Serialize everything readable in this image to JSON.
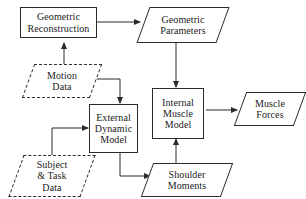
{
  "diagram": {
    "stroke_color": "#2b2b2b",
    "background_color": "#ffffff",
    "nodes": [
      {
        "id": "geometric-reconstruction",
        "label": "Geometric\nReconstruction",
        "shape": "rectangle",
        "border": "solid"
      },
      {
        "id": "geometric-parameters",
        "label": "Geometric\nParameters",
        "shape": "parallelogram",
        "border": "solid"
      },
      {
        "id": "motion-data",
        "label": "Motion\nData",
        "shape": "parallelogram",
        "border": "dashed"
      },
      {
        "id": "external-dynamic-model",
        "label": "External\nDynamic\nModel",
        "shape": "rectangle",
        "border": "solid"
      },
      {
        "id": "internal-muscle-model",
        "label": "Internal\nMuscle\nModel",
        "shape": "rectangle",
        "border": "solid"
      },
      {
        "id": "muscle-forces",
        "label": "Muscle\nForces",
        "shape": "parallelogram",
        "border": "solid"
      },
      {
        "id": "subject-task-data",
        "label": "Subject\n& Task\nData",
        "shape": "parallelogram",
        "border": "dashed"
      },
      {
        "id": "shoulder-moments",
        "label": "Shoulder\nMoments",
        "shape": "parallelogram",
        "border": "solid"
      }
    ],
    "edges": [
      {
        "id": "edge-reconstruction-to-parameters",
        "from": "geometric-reconstruction",
        "to": "geometric-parameters"
      },
      {
        "id": "edge-parameters-to-internal-muscle",
        "from": "geometric-parameters",
        "to": "internal-muscle-model"
      },
      {
        "id": "edge-motion-to-reconstruction",
        "from": "motion-data",
        "to": "geometric-reconstruction"
      },
      {
        "id": "edge-motion-to-external-dynamic",
        "from": "motion-data",
        "to": "external-dynamic-model"
      },
      {
        "id": "edge-subject-to-external-dynamic",
        "from": "subject-task-data",
        "to": "external-dynamic-model"
      },
      {
        "id": "edge-external-dynamic-to-shoulder",
        "from": "external-dynamic-model",
        "to": "shoulder-moments"
      },
      {
        "id": "edge-shoulder-to-internal-muscle",
        "from": "shoulder-moments",
        "to": "internal-muscle-model"
      },
      {
        "id": "edge-internal-muscle-to-forces",
        "from": "internal-muscle-model",
        "to": "muscle-forces"
      }
    ]
  }
}
